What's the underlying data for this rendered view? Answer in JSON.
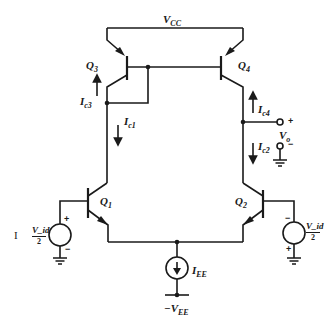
{
  "diagram": {
    "type": "circuit-schematic",
    "colors": {
      "wire": "#1a1a1a",
      "background": "#ffffff"
    },
    "labels": {
      "vcc": "V",
      "vcc_sub": "CC",
      "vee": "−V",
      "vee_sub": "EE",
      "q1": "Q",
      "q1_sub": "1",
      "q2": "Q",
      "q2_sub": "2",
      "q3": "Q",
      "q3_sub": "3",
      "q4": "Q",
      "q4_sub": "4",
      "ic1": "I",
      "ic1_sub": "c1",
      "ic2": "I",
      "ic2_sub": "c2",
      "ic3": "I",
      "ic3_sub": "c3",
      "ic4": "I",
      "ic4_sub": "c4",
      "iee": "I",
      "iee_sub": "EE",
      "vo": "V",
      "vo_sub": "o",
      "vo_plus": "+",
      "vo_minus": "−",
      "vid_left_num": "V_id",
      "vid_left_den": "2",
      "vid_right_num": "V_id",
      "vid_right_den": "2",
      "src_left_plus": "+",
      "src_left_minus": "−",
      "src_right_plus": "+",
      "src_right_minus": "−",
      "margin_mark": "I"
    },
    "components": [
      {
        "id": "Q1",
        "kind": "npn-transistor"
      },
      {
        "id": "Q2",
        "kind": "npn-transistor"
      },
      {
        "id": "Q3",
        "kind": "pnp-transistor",
        "role": "current-mirror (diode-connected)"
      },
      {
        "id": "Q4",
        "kind": "pnp-transistor",
        "role": "current-mirror output"
      },
      {
        "id": "IEE",
        "kind": "current-source"
      },
      {
        "id": "Vid/2 left",
        "kind": "voltage-source"
      },
      {
        "id": "Vid/2 right",
        "kind": "voltage-source"
      }
    ]
  }
}
